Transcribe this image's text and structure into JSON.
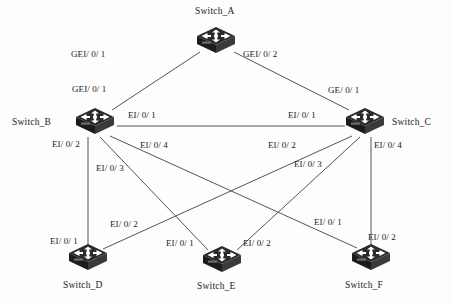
{
  "diagram": {
    "type": "network-topology",
    "background_color": "#fdfdfd",
    "line_color": "#555555",
    "text_color": "#1a1a1a",
    "device_color": "#2b2b2b"
  },
  "nodes": [
    {
      "id": "A",
      "label": "Switch_A",
      "icon": "switch-icon",
      "x": 216,
      "y": 41,
      "label_x": 195,
      "label_y": 6
    },
    {
      "id": "B",
      "label": "Switch_B",
      "icon": "switch-icon",
      "x": 95,
      "y": 122,
      "label_x": 12,
      "label_y": 117
    },
    {
      "id": "C",
      "label": "Switch_C",
      "icon": "switch-icon",
      "x": 365,
      "y": 122,
      "label_x": 392,
      "label_y": 117
    },
    {
      "id": "D",
      "label": "Switch_D",
      "icon": "switch-icon",
      "x": 88,
      "y": 258,
      "label_x": 63,
      "label_y": 280
    },
    {
      "id": "E",
      "label": "Switch_E",
      "icon": "switch-icon",
      "x": 222,
      "y": 260,
      "label_x": 197,
      "label_y": 281
    },
    {
      "id": "F",
      "label": "Switch_F",
      "icon": "switch-icon",
      "x": 371,
      "y": 258,
      "label_x": 345,
      "label_y": 280
    }
  ],
  "links": [
    {
      "from": "B",
      "to": "A",
      "x1": 112,
      "y1": 110,
      "x2": 200,
      "y2": 52
    },
    {
      "from": "A",
      "to": "C",
      "x1": 234,
      "y1": 52,
      "x2": 349,
      "y2": 110
    },
    {
      "from": "B",
      "to": "C",
      "x1": 117,
      "y1": 126,
      "x2": 345,
      "y2": 126
    },
    {
      "from": "B",
      "to": "D",
      "x1": 88,
      "y1": 137,
      "x2": 88,
      "y2": 245
    },
    {
      "from": "B",
      "to": "E",
      "x1": 100,
      "y1": 137,
      "x2": 208,
      "y2": 250
    },
    {
      "from": "B",
      "to": "F",
      "x1": 110,
      "y1": 136,
      "x2": 357,
      "y2": 248
    },
    {
      "from": "C",
      "to": "D",
      "x1": 352,
      "y1": 136,
      "x2": 103,
      "y2": 249
    },
    {
      "from": "C",
      "to": "E",
      "x1": 360,
      "y1": 137,
      "x2": 237,
      "y2": 250
    },
    {
      "from": "C",
      "to": "F",
      "x1": 371,
      "y1": 137,
      "x2": 371,
      "y2": 245
    }
  ],
  "port_labels": [
    {
      "id": "b-to-a",
      "text": "GEI/ 0/ 1",
      "x": 71,
      "y": 49
    },
    {
      "id": "a-to-c",
      "text": "GEI/ 0/ 2",
      "x": 243,
      "y": 49
    },
    {
      "id": "b-up",
      "text": "GEI/ 0/ 1",
      "x": 72,
      "y": 84
    },
    {
      "id": "c-up",
      "text": "GE/ 0/ 1",
      "x": 328,
      "y": 85
    },
    {
      "id": "b-e01",
      "text": "EI/ 0/ 1",
      "x": 128,
      "y": 110
    },
    {
      "id": "c-e01",
      "text": "EI/ 0/ 1",
      "x": 288,
      "y": 110
    },
    {
      "id": "b-e02",
      "text": "EI/ 0/ 2",
      "x": 52,
      "y": 139
    },
    {
      "id": "b-e04",
      "text": "EI/ 0/ 4",
      "x": 140,
      "y": 140
    },
    {
      "id": "c-e02",
      "text": "EI/ 0/ 2",
      "x": 268,
      "y": 140
    },
    {
      "id": "c-e04",
      "text": "EI/ 0/ 4",
      "x": 374,
      "y": 140
    },
    {
      "id": "b-e03",
      "text": "EI/ 0/ 3",
      "x": 96,
      "y": 163
    },
    {
      "id": "c-e03",
      "text": "EI/ 0/ 3",
      "x": 294,
      "y": 159
    },
    {
      "id": "d-e02",
      "text": "EI/ 0/ 2",
      "x": 110,
      "y": 219
    },
    {
      "id": "f-e01",
      "text": "EI/ 0/ 1",
      "x": 314,
      "y": 217
    },
    {
      "id": "d-e01",
      "text": "EI/ 0/ 1",
      "x": 50,
      "y": 236
    },
    {
      "id": "e-e01",
      "text": "EI/ 0/ 1",
      "x": 166,
      "y": 238
    },
    {
      "id": "e-e02",
      "text": "EI/ 0/ 2",
      "x": 243,
      "y": 238
    },
    {
      "id": "f-e02",
      "text": "EI/ 0/ 2",
      "x": 368,
      "y": 232
    }
  ]
}
